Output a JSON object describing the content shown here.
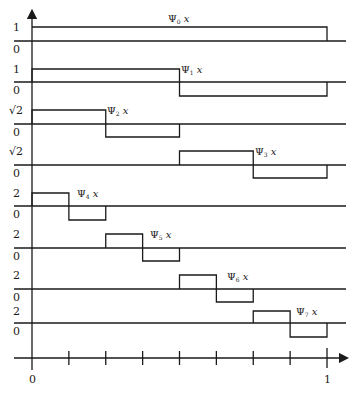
{
  "x_axis": {
    "min_label": "0",
    "max_label": "1",
    "ticks": 8
  },
  "functions": [
    {
      "name": "Ψ",
      "subscript": "0",
      "var": "x",
      "y_top_label": "1",
      "y_base_label": "0",
      "amplitude": 1,
      "support": [
        0,
        1
      ],
      "sign_pattern": "positive"
    },
    {
      "name": "Ψ",
      "subscript": "1",
      "var": "x",
      "y_top_label": "1",
      "y_base_label": "0",
      "amplitude": 1,
      "support": [
        0,
        1
      ],
      "sign_pattern": "pos-neg"
    },
    {
      "name": "Ψ",
      "subscript": "2",
      "var": "x",
      "y_top_label": "√2",
      "y_base_label": "0",
      "amplitude": 1.414,
      "support": [
        0,
        0.5
      ],
      "sign_pattern": "pos-neg"
    },
    {
      "name": "Ψ",
      "subscript": "3",
      "var": "x",
      "y_top_label": "√2",
      "y_base_label": "0",
      "amplitude": 1.414,
      "support": [
        0.5,
        1
      ],
      "sign_pattern": "pos-neg"
    },
    {
      "name": "Ψ",
      "subscript": "4",
      "var": "x",
      "y_top_label": "2",
      "y_base_label": "0",
      "amplitude": 2,
      "support": [
        0,
        0.25
      ],
      "sign_pattern": "pos-neg"
    },
    {
      "name": "Ψ",
      "subscript": "5",
      "var": "x",
      "y_top_label": "2",
      "y_base_label": "0",
      "amplitude": 2,
      "support": [
        0.25,
        0.5
      ],
      "sign_pattern": "pos-neg"
    },
    {
      "name": "Ψ",
      "subscript": "6",
      "var": "x",
      "y_top_label": "2",
      "y_base_label": "0",
      "amplitude": 2,
      "support": [
        0.5,
        0.75
      ],
      "sign_pattern": "pos-neg"
    },
    {
      "name": "Ψ",
      "subscript": "7",
      "var": "x",
      "y_top_label": "2",
      "y_base_label": "0",
      "amplitude": 2,
      "support": [
        0.75,
        1
      ],
      "sign_pattern": "pos-neg"
    }
  ]
}
